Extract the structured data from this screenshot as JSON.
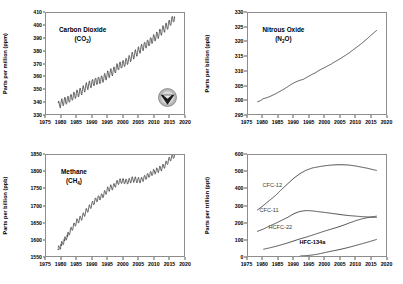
{
  "figure": {
    "background_color": "#ffffff",
    "frame_color": "#8d8d8d",
    "line_color": "#3a3a3a"
  },
  "panels": [
    {
      "id": "co2",
      "gas_name": "Carbon Dioxide",
      "formula_main": "(CO",
      "formula_sub": "2",
      "formula_tail": ")",
      "ylabel": "Parts per million (ppm)",
      "logo": "noaa-seal-logo"
    },
    {
      "id": "n2o",
      "gas_name": "Nitrous Oxide",
      "formula_main": "(N",
      "formula_sub": "2",
      "formula_tail": "O)",
      "ylabel": "Parts per billion (ppb)",
      "logo": null
    },
    {
      "id": "ch4",
      "gas_name": "Methane",
      "formula_main": "(CH",
      "formula_sub": "4",
      "formula_tail": ")",
      "ylabel": "Parts per billion (ppb)",
      "logo": null
    },
    {
      "id": "halo",
      "gas_name": "",
      "formula_main": "",
      "formula_sub": "",
      "formula_tail": "",
      "ylabel": "Parts per trillion (ppt)",
      "logo": null
    }
  ],
  "chart_data": [
    {
      "id": "co2",
      "type": "line",
      "title": "Carbon Dioxide (CO2)",
      "xlabel": "",
      "ylabel": "Parts per million (ppm)",
      "xlim": [
        1975,
        2020
      ],
      "ylim": [
        330,
        410
      ],
      "xticks": [
        1975,
        1980,
        1985,
        1990,
        1995,
        2000,
        2005,
        2010,
        2015,
        2020
      ],
      "yticks": [
        330,
        340,
        350,
        360,
        370,
        380,
        390,
        400,
        410
      ],
      "grid": false,
      "legend": "none",
      "note": "monthly mean with seasonal sawtooth cycle, amplitude approx 3 ppm peak-to-peak",
      "seasonal_amplitude": 3.0,
      "series": [
        {
          "name": "CO2 annual mean",
          "x": [
            1979,
            1980,
            1981,
            1982,
            1983,
            1984,
            1985,
            1986,
            1987,
            1988,
            1989,
            1990,
            1991,
            1992,
            1993,
            1994,
            1995,
            1996,
            1997,
            1998,
            1999,
            2000,
            2001,
            2002,
            2003,
            2004,
            2005,
            2006,
            2007,
            2008,
            2009,
            2010,
            2011,
            2012,
            2013,
            2014,
            2015,
            2016,
            2017
          ],
          "values": [
            336.8,
            338.7,
            340.1,
            341.0,
            342.6,
            344.3,
            345.9,
            347.2,
            349.0,
            351.4,
            352.9,
            354.2,
            355.6,
            356.4,
            357.1,
            358.8,
            360.8,
            362.6,
            363.7,
            366.6,
            368.3,
            369.5,
            371.0,
            373.1,
            375.6,
            377.4,
            379.7,
            381.9,
            383.7,
            385.6,
            387.4,
            389.8,
            391.6,
            393.8,
            396.5,
            398.6,
            400.8,
            404.2,
            406.5
          ],
          "units": "ppm"
        }
      ]
    },
    {
      "id": "n2o",
      "type": "line",
      "title": "Nitrous Oxide (N2O)",
      "xlabel": "",
      "ylabel": "Parts per billion (ppb)",
      "xlim": [
        1975,
        2020
      ],
      "ylim": [
        295,
        330
      ],
      "xticks": [
        1975,
        1980,
        1985,
        1990,
        1995,
        2000,
        2005,
        2010,
        2015,
        2020
      ],
      "yticks": [
        295,
        300,
        305,
        310,
        315,
        320,
        325,
        330
      ],
      "grid": false,
      "legend": "none",
      "note": "steady near-linear increase with small month-to-month noise",
      "series": [
        {
          "name": "N2O annual mean",
          "x": [
            1978,
            1979,
            1980,
            1981,
            1982,
            1983,
            1984,
            1985,
            1986,
            1987,
            1988,
            1989,
            1990,
            1991,
            1992,
            1993,
            1994,
            1995,
            1996,
            1997,
            1998,
            1999,
            2000,
            2001,
            2002,
            2003,
            2004,
            2005,
            2006,
            2007,
            2008,
            2009,
            2010,
            2011,
            2012,
            2013,
            2014,
            2015,
            2016,
            2017
          ],
          "values": [
            299.2,
            299.6,
            300.3,
            300.6,
            301.0,
            301.5,
            302.0,
            302.6,
            303.2,
            303.8,
            304.5,
            305.2,
            305.8,
            306.3,
            306.7,
            307.0,
            307.6,
            308.2,
            308.8,
            309.3,
            310.0,
            310.6,
            311.1,
            311.7,
            312.2,
            312.9,
            313.5,
            314.1,
            314.8,
            315.5,
            316.2,
            317.0,
            317.8,
            318.6,
            319.4,
            320.3,
            321.2,
            322.2,
            323.1,
            324.0
          ],
          "units": "ppb"
        }
      ]
    },
    {
      "id": "ch4",
      "type": "line",
      "title": "Methane (CH4)",
      "xlabel": "",
      "ylabel": "Parts per billion (ppb)",
      "xlim": [
        1975,
        2020
      ],
      "ylim": [
        1550,
        1850
      ],
      "xticks": [
        1975,
        1980,
        1985,
        1990,
        1995,
        2000,
        2005,
        2010,
        2015,
        2020
      ],
      "yticks": [
        1550,
        1600,
        1650,
        1700,
        1750,
        1800,
        1850
      ],
      "grid": false,
      "legend": "none",
      "note": "sparse discrete points before 1983, then continuous record; plateau 1999-2006 then renewed rise",
      "seasonal_amplitude": 8.0,
      "series": [
        {
          "name": "CH4 annual mean",
          "x": [
            1979,
            1980,
            1981,
            1982,
            1983,
            1984,
            1985,
            1986,
            1987,
            1988,
            1989,
            1990,
            1991,
            1992,
            1993,
            1994,
            1995,
            1996,
            1997,
            1998,
            1999,
            2000,
            2001,
            2002,
            2003,
            2004,
            2005,
            2006,
            2007,
            2008,
            2009,
            2010,
            2011,
            2012,
            2013,
            2014,
            2015,
            2016,
            2017
          ],
          "values": [
            1570,
            1583,
            1597,
            1610,
            1626,
            1639,
            1652,
            1659,
            1668,
            1681,
            1692,
            1703,
            1714,
            1721,
            1726,
            1735,
            1746,
            1753,
            1755,
            1766,
            1772,
            1773,
            1771,
            1772,
            1777,
            1777,
            1775,
            1775,
            1781,
            1787,
            1793,
            1799,
            1803,
            1808,
            1813,
            1822,
            1834,
            1843,
            1850
          ],
          "units": "ppb"
        }
      ]
    },
    {
      "id": "halo",
      "type": "line",
      "title": "Halocarbons",
      "xlabel": "",
      "ylabel": "Parts per trillion (ppt)",
      "xlim": [
        1975,
        2020
      ],
      "ylim": [
        0,
        600
      ],
      "xticks": [
        1975,
        1980,
        1985,
        1990,
        1995,
        2000,
        2005,
        2010,
        2015,
        2020
      ],
      "yticks": [
        0,
        100,
        200,
        300,
        400,
        500,
        600
      ],
      "grid": false,
      "legend": "inline-labels",
      "series": [
        {
          "name": "CFC-12",
          "label": "CFC-12",
          "x": [
            1978,
            1980,
            1982,
            1984,
            1986,
            1988,
            1990,
            1992,
            1994,
            1996,
            1998,
            2000,
            2002,
            2004,
            2006,
            2008,
            2010,
            2012,
            2014,
            2016,
            2017
          ],
          "values": [
            272,
            300,
            330,
            360,
            396,
            430,
            463,
            490,
            510,
            523,
            530,
            536,
            540,
            542,
            542,
            540,
            535,
            528,
            521,
            512,
            508
          ],
          "units": "ppt"
        },
        {
          "name": "CFC-11",
          "label": "CFC-11",
          "x": [
            1978,
            1980,
            1982,
            1984,
            1986,
            1988,
            1990,
            1992,
            1994,
            1996,
            1998,
            2000,
            2002,
            2004,
            2006,
            2008,
            2010,
            2012,
            2014,
            2016,
            2017
          ],
          "values": [
            146,
            160,
            178,
            194,
            212,
            230,
            252,
            265,
            270,
            268,
            263,
            259,
            254,
            249,
            244,
            240,
            237,
            234,
            232,
            230,
            229
          ],
          "units": "ppt"
        },
        {
          "name": "HCFC-22",
          "label": "HCFC-22",
          "x": [
            1980,
            1982,
            1984,
            1986,
            1988,
            1990,
            1992,
            1994,
            1996,
            1998,
            2000,
            2002,
            2004,
            2006,
            2008,
            2010,
            2012,
            2014,
            2016,
            2017
          ],
          "values": [
            40,
            48,
            57,
            67,
            78,
            90,
            102,
            112,
            124,
            136,
            148,
            159,
            170,
            182,
            196,
            209,
            220,
            228,
            234,
            237
          ],
          "units": "ppt"
        },
        {
          "name": "HFC-134a",
          "label": "HFC-134a",
          "x": [
            1992,
            1994,
            1996,
            1998,
            2000,
            2002,
            2004,
            2006,
            2008,
            2010,
            2012,
            2014,
            2016,
            2017
          ],
          "values": [
            0,
            2,
            6,
            12,
            20,
            28,
            35,
            43,
            52,
            62,
            72,
            82,
            93,
            99
          ],
          "units": "ppt"
        }
      ]
    }
  ]
}
